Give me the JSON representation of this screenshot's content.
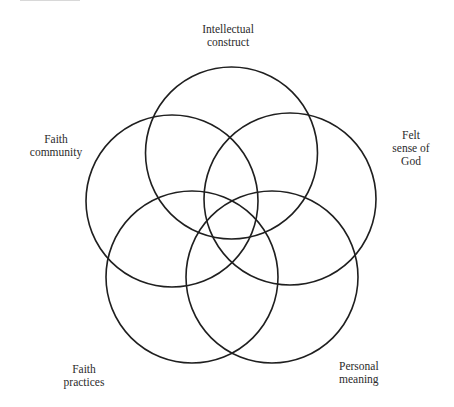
{
  "diagram": {
    "type": "five-circle-venn",
    "circles": [
      {
        "id": "intellectual",
        "cx": 231.5,
        "cy": 153,
        "r": 86,
        "label_lines": [
          "Intellectual",
          "construct"
        ]
      },
      {
        "id": "felt",
        "cx": 290,
        "cy": 199,
        "r": 86,
        "label_lines": [
          "Felt",
          "sense of",
          "God"
        ]
      },
      {
        "id": "personal",
        "cx": 272,
        "cy": 277,
        "r": 86,
        "label_lines": [
          "Personal",
          "meaning"
        ]
      },
      {
        "id": "practices",
        "cx": 192,
        "cy": 277,
        "r": 86,
        "label_lines": [
          "Faith",
          "practices"
        ]
      },
      {
        "id": "community",
        "cx": 172,
        "cy": 201,
        "r": 86,
        "label_lines": [
          "Faith",
          "community"
        ]
      }
    ],
    "stroke_color": "#1f1f1f",
    "text_color": "#2b2b2b"
  },
  "labels": {
    "intellectual": {
      "line1": "Intellectual",
      "line2": "construct"
    },
    "felt": {
      "line1": "Felt",
      "line2": "sense of",
      "line3": "God"
    },
    "personal": {
      "line1": "Personal",
      "line2": "meaning"
    },
    "practices": {
      "line1": "Faith",
      "line2": "practices"
    },
    "community": {
      "line1": "Faith",
      "line2": "community"
    }
  }
}
